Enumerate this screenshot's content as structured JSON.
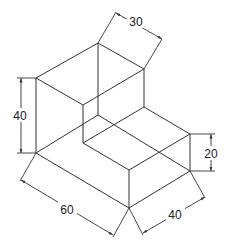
{
  "figure": {
    "type": "isometric-drawing",
    "line_color": "#333333",
    "background": "#ffffff"
  },
  "dimensions": [
    {
      "id": "depth-top",
      "label": "30"
    },
    {
      "id": "height-tall",
      "label": "40"
    },
    {
      "id": "height-low",
      "label": "20"
    },
    {
      "id": "length",
      "label": "60"
    },
    {
      "id": "width",
      "label": "40"
    }
  ]
}
